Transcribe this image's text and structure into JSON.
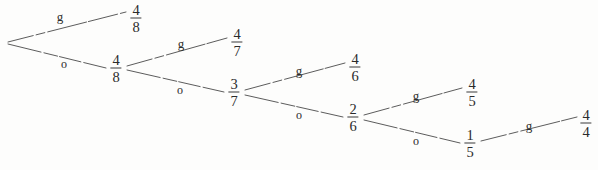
{
  "diagram": {
    "type": "binary-decision-tree",
    "title": "",
    "branch_labels": {
      "up": "g",
      "down": "o"
    },
    "root": {
      "id": "root",
      "label": "",
      "x": 6,
      "y": 43
    },
    "nodes": [
      {
        "id": "n1",
        "numerator": "4",
        "denominator": "8",
        "x": 116,
        "y": 68,
        "kind": "internal"
      },
      {
        "id": "n2",
        "numerator": "3",
        "denominator": "7",
        "x": 234,
        "y": 92,
        "kind": "internal"
      },
      {
        "id": "n3",
        "numerator": "2",
        "denominator": "6",
        "x": 353,
        "y": 117,
        "kind": "internal"
      },
      {
        "id": "n4",
        "numerator": "1",
        "denominator": "5",
        "x": 470,
        "y": 143,
        "kind": "internal"
      }
    ],
    "leaves": [
      {
        "id": "l0",
        "numerator": "4",
        "denominator": "8",
        "x": 136,
        "y": 18,
        "kind": "leaf"
      },
      {
        "id": "l1",
        "numerator": "4",
        "denominator": "7",
        "x": 237,
        "y": 42,
        "kind": "leaf"
      },
      {
        "id": "l2",
        "numerator": "4",
        "denominator": "6",
        "x": 355,
        "y": 67,
        "kind": "leaf"
      },
      {
        "id": "l3",
        "numerator": "4",
        "denominator": "5",
        "x": 472,
        "y": 92,
        "kind": "leaf"
      },
      {
        "id": "l4",
        "numerator": "4",
        "denominator": "4",
        "x": 586,
        "y": 123,
        "kind": "leaf"
      }
    ],
    "edges": [
      {
        "id": "e0g",
        "from": "root",
        "to": "l0",
        "label": "g",
        "label_x": 60,
        "label_y": 16,
        "x1": 8,
        "y1": 42,
        "x2": 126,
        "y2": 12
      },
      {
        "id": "e0o",
        "from": "root",
        "to": "n1",
        "label": "o",
        "label_x": 64,
        "label_y": 64,
        "x1": 8,
        "y1": 44,
        "x2": 106,
        "y2": 68
      },
      {
        "id": "e1g",
        "from": "n1",
        "to": "l1",
        "label": "g",
        "label_x": 181,
        "label_y": 43,
        "x1": 127,
        "y1": 66,
        "x2": 227,
        "y2": 38
      },
      {
        "id": "e1o",
        "from": "n1",
        "to": "n2",
        "label": "o",
        "label_x": 180,
        "label_y": 90,
        "x1": 127,
        "y1": 70,
        "x2": 224,
        "y2": 92
      },
      {
        "id": "e2g",
        "from": "n2",
        "to": "l2",
        "label": "g",
        "label_x": 299,
        "label_y": 70,
        "x1": 245,
        "y1": 90,
        "x2": 345,
        "y2": 63
      },
      {
        "id": "e2o",
        "from": "n2",
        "to": "n3",
        "label": "o",
        "label_x": 299,
        "label_y": 115,
        "x1": 245,
        "y1": 95,
        "x2": 343,
        "y2": 117
      },
      {
        "id": "e3g",
        "from": "n3",
        "to": "l3",
        "label": "g",
        "label_x": 416,
        "label_y": 95,
        "x1": 364,
        "y1": 115,
        "x2": 462,
        "y2": 88
      },
      {
        "id": "e3o",
        "from": "n3",
        "to": "n4",
        "label": "o",
        "label_x": 416,
        "label_y": 141,
        "x1": 364,
        "y1": 120,
        "x2": 460,
        "y2": 143
      },
      {
        "id": "e4g",
        "from": "n4",
        "to": "l4",
        "label": "g",
        "label_x": 529,
        "label_y": 125,
        "x1": 481,
        "y1": 141,
        "x2": 577,
        "y2": 117
      }
    ],
    "colors": {
      "background": "#fdfdfc",
      "ink": "#2b2b2b",
      "line": "#4a4a4a"
    }
  }
}
